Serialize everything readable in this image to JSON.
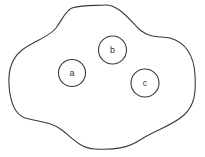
{
  "diagram": {
    "type": "set-diagram",
    "region": {
      "shape": "irregular-blob",
      "stroke_color": "#3a3a3a"
    },
    "nodes": [
      {
        "label": "a",
        "cx": 72,
        "cy": 73,
        "r": 13.5
      },
      {
        "label": "b",
        "cx": 112.5,
        "cy": 50,
        "r": 14
      },
      {
        "label": "c",
        "cx": 145,
        "cy": 83,
        "r": 14
      }
    ]
  }
}
